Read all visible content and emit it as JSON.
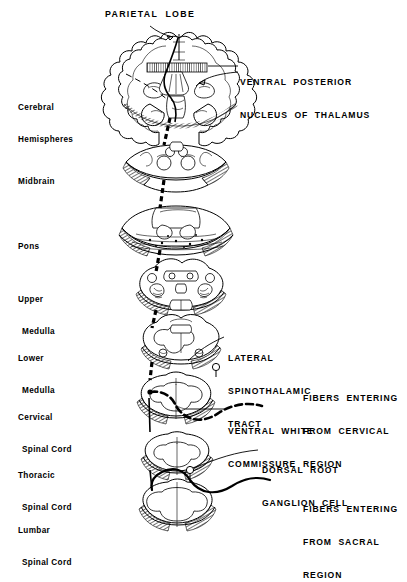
{
  "figure": {
    "title": "PARIETAL  LOBE",
    "background_color": "#ffffff",
    "ink_color": "#000000"
  },
  "region_labels": [
    {
      "id": "cerebral-hemispheres",
      "line1": "Cerebral",
      "line2": "Hemispheres",
      "x": 18,
      "y": 82
    },
    {
      "id": "midbrain",
      "line1": "Midbrain",
      "line2": "",
      "x": 18,
      "y": 156
    },
    {
      "id": "pons",
      "line1": "Pons",
      "line2": "",
      "x": 18,
      "y": 221
    },
    {
      "id": "upper-medulla",
      "line1": "Upper",
      "line2": "Medulla",
      "x": 18,
      "y": 274
    },
    {
      "id": "lower-medulla",
      "line1": "Lower",
      "line2": "Medulla",
      "x": 18,
      "y": 333
    },
    {
      "id": "cervical-spinal-cord",
      "line1": "Cervical",
      "line2": "Spinal Cord",
      "x": 18,
      "y": 392
    },
    {
      "id": "thoracic-spinal-cord",
      "line1": "Thoracic",
      "line2": "Spinal Cord",
      "x": 18,
      "y": 450
    },
    {
      "id": "lumbar-spinal-cord",
      "line1": "Lumbar",
      "line2": "Spinal Cord",
      "x": 18,
      "y": 505
    }
  ],
  "callouts": [
    {
      "id": "ventral-posterior-nucleus",
      "lines": [
        "VENTRAL  POSTERIOR",
        "NUCLEUS  OF  THALAMUS"
      ],
      "x": 240,
      "y": 55
    },
    {
      "id": "lateral-spinothalamic-tract",
      "lines": [
        "LATERAL",
        "SPINOTHALAMIC",
        "TRACT"
      ],
      "x": 228,
      "y": 331
    },
    {
      "id": "fibers-entering-cervical",
      "lines": [
        "FIBERS  ENTERING",
        "FROM  CERVICAL",
        "REGION"
      ],
      "x": 303,
      "y": 371
    },
    {
      "id": "ventral-white-commissure",
      "lines": [
        "VENTRAL  WHITE",
        "COMMISSURE"
      ],
      "x": 228,
      "y": 404
    },
    {
      "id": "dorsal-root-ganglion-cell",
      "lines": [
        "DORSAL  ROOT",
        "GANGLION  CELL"
      ],
      "x": 262,
      "y": 443
    },
    {
      "id": "fibers-entering-sacral",
      "lines": [
        "FIBERS  ENTERING",
        "FROM  SACRAL",
        "REGION"
      ],
      "x": 303,
      "y": 482
    }
  ],
  "sections": [
    {
      "id": "cerebral-hemispheres-section",
      "name": "cerebral-hemispheres",
      "cy": 90
    },
    {
      "id": "midbrain-section",
      "name": "midbrain",
      "cy": 168
    },
    {
      "id": "pons-section",
      "name": "pons",
      "cy": 228
    },
    {
      "id": "upper-medulla-section",
      "name": "upper-medulla",
      "cy": 290
    },
    {
      "id": "lower-medulla-section",
      "name": "lower-medulla",
      "cy": 345
    },
    {
      "id": "cervical-cord-section",
      "name": "cervical-cord",
      "cy": 398
    },
    {
      "id": "thoracic-cord-section",
      "name": "thoracic-cord",
      "cy": 455
    },
    {
      "id": "lumbar-cord-section",
      "name": "lumbar-cord",
      "cy": 505
    }
  ],
  "pathway": {
    "tract_style_upper": "dashed",
    "tract_style_lower": "solid",
    "cervical_fiber_style": "dashed",
    "sacral_fiber_style": "solid"
  }
}
